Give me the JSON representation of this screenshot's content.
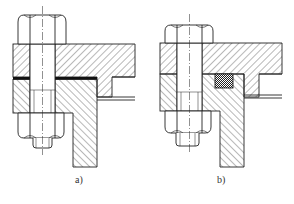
{
  "figure": {
    "panels": [
      {
        "id": "a",
        "label": "a)",
        "seal_type": "flat gasket (black strip between flanges)"
      },
      {
        "id": "b",
        "label": "b)",
        "seal_type": "packing ring in groove (cross-hatched square)"
      }
    ]
  },
  "colors": {
    "line": "#222222",
    "background": "#ffffff",
    "gasket": "#111111"
  }
}
